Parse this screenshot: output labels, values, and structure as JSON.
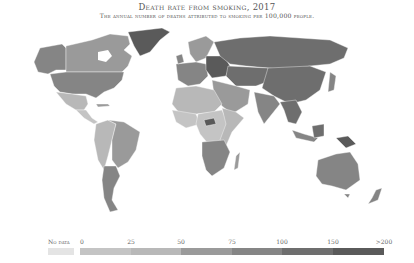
{
  "header": {
    "title": "Death rate from smoking, 2017",
    "subtitle": "The annual number of deaths attributed to smoking per 100,000 people."
  },
  "legend": {
    "no_data_label": "No data",
    "no_data_color": "#e4e4e4",
    "ticks": [
      {
        "label": "0",
        "x": 80
      },
      {
        "label": "25",
        "x": 131
      },
      {
        "label": "50",
        "x": 181
      },
      {
        "label": "75",
        "x": 232
      },
      {
        "label": "100",
        "x": 282
      },
      {
        "label": "150",
        "x": 333
      },
      {
        "label": ">200",
        "x": 384
      }
    ],
    "bins": [
      {
        "range": "0-25",
        "color": "#c4c4c4",
        "width": 51
      },
      {
        "range": "25-50",
        "color": "#b8b8b8",
        "width": 50
      },
      {
        "range": "50-75",
        "color": "#9a9a9a",
        "width": 51
      },
      {
        "range": "75-100",
        "color": "#858585",
        "width": 50
      },
      {
        "range": "100-150",
        "color": "#6e6e6e",
        "width": 51
      },
      {
        "range": "150-200",
        "color": "#5a5a5a",
        "width": 51
      }
    ]
  },
  "map": {
    "regions": [
      {
        "name": "Canada",
        "bin": "50-75"
      },
      {
        "name": "Alaska",
        "bin": "75-100"
      },
      {
        "name": "United States",
        "bin": "75-100"
      },
      {
        "name": "Greenland",
        "bin": "150-200"
      },
      {
        "name": "Mexico",
        "bin": "25-50"
      },
      {
        "name": "Central America",
        "bin": "0-25"
      },
      {
        "name": "Brazil",
        "bin": "50-75"
      },
      {
        "name": "Andean South America",
        "bin": "25-50"
      },
      {
        "name": "Argentina",
        "bin": "75-100"
      },
      {
        "name": "Europe West",
        "bin": "75-100"
      },
      {
        "name": "Eastern Europe",
        "bin": "150-200"
      },
      {
        "name": "Scandinavia",
        "bin": "50-75"
      },
      {
        "name": "Russia",
        "bin": "100-150"
      },
      {
        "name": "Central Asia",
        "bin": "100-150"
      },
      {
        "name": "China",
        "bin": "100-150"
      },
      {
        "name": "Middle East",
        "bin": "50-75"
      },
      {
        "name": "India",
        "bin": "75-100"
      },
      {
        "name": "Southeast Asia",
        "bin": "100-150"
      },
      {
        "name": "North Africa",
        "bin": "25-50"
      },
      {
        "name": "West Africa",
        "bin": "0-25"
      },
      {
        "name": "Central Africa",
        "bin": "0-25"
      },
      {
        "name": "East Africa",
        "bin": "25-50"
      },
      {
        "name": "Southern Africa",
        "bin": "75-100"
      },
      {
        "name": "Madagascar",
        "bin": "50-75"
      },
      {
        "name": "Australia",
        "bin": "75-100"
      },
      {
        "name": "New Zealand",
        "bin": "75-100"
      },
      {
        "name": "Papua New Guinea",
        "bin": "150-200"
      },
      {
        "name": "Indonesia",
        "bin": "75-100"
      }
    ]
  }
}
